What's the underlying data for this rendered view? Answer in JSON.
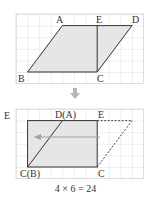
{
  "figure": {
    "top": {
      "labels": {
        "A": "A",
        "E": "E",
        "D": "D",
        "B": "B",
        "C": "C"
      },
      "shape": "parallelogram ABCD with vertical segment EC"
    },
    "arrow_down": "⇓",
    "bottom": {
      "labels": {
        "DA": "D(A)",
        "E_top": "E",
        "E_left": "E",
        "CB": "C(B)",
        "C": "C"
      },
      "shape": "rectangle after moving triangle CDE to the left"
    },
    "equation": "4 × 6 = 24"
  },
  "colors": {
    "grid": "#c8c8c8",
    "fill": "#e6e6e6",
    "stroke": "#333333",
    "arrow": "#b5b5b5"
  }
}
